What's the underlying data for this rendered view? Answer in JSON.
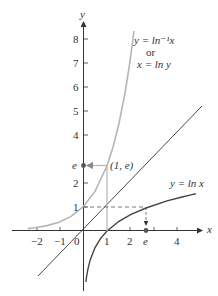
{
  "figure": {
    "type": "function-graph",
    "axes": {
      "x_label": "x",
      "y_label": "y",
      "x_ticks": [
        "−2",
        "−1",
        "0",
        "1",
        "2",
        "e",
        "4"
      ],
      "y_ticks": [
        "1",
        "2",
        "e",
        "4",
        "5",
        "6",
        "7",
        "8"
      ]
    },
    "curves": [
      {
        "name": "inverse-ln",
        "label_line1": "y = ln⁻¹x",
        "label_line2": "or",
        "label_line3": "x = ln y",
        "color": "#b5b5b5"
      },
      {
        "name": "ln",
        "label": "y = ln x",
        "color": "#444444"
      },
      {
        "name": "identity",
        "label": "y = x",
        "color": "#333333"
      }
    ],
    "annotations": {
      "point_1_e": "(1, e)",
      "e_marker_y": "e",
      "e_marker_x": "e"
    },
    "colors": {
      "axis": "#333333",
      "light_curve": "#b5b5b5",
      "dark_curve": "#444444",
      "dashed": "#555555"
    }
  }
}
